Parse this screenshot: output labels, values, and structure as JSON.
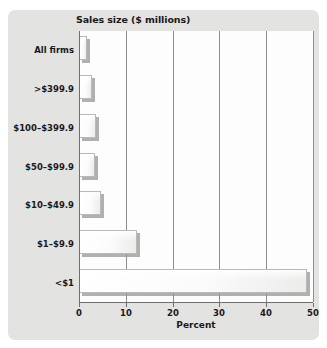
{
  "chart_data": {
    "type": "bar",
    "orientation": "horizontal",
    "title": "Sales size ($ millions)",
    "xlabel": "Percent",
    "ylabel": "",
    "categories": [
      "All firms",
      ">$399.9",
      "$100–$399.9",
      "$50–$99.9",
      "$10–$49.9",
      "$1–$9.9",
      "<$1"
    ],
    "values": [
      1.8,
      2.7,
      3.6,
      3.4,
      4.8,
      12.4,
      48.7
    ],
    "xlim": [
      0,
      50
    ],
    "xticks": [
      0,
      10,
      20,
      30,
      40,
      50
    ],
    "xtick_labels": [
      "0",
      "10",
      "20",
      "30",
      "40",
      "50"
    ],
    "grid": "vertical",
    "legend": null
  },
  "colors": {
    "panel_background": "#e3e3e1",
    "plot_background": "#fdfdfd",
    "axis": "#6f6f6f",
    "gridline": "#8e8e8e",
    "bar_fill": "#fbfbfb",
    "bar_border": "#b9b9b6",
    "bar_shadow": "#969694",
    "text": "#1a1a1a"
  }
}
